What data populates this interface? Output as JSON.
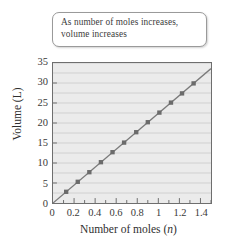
{
  "callout": {
    "line1": "As number of moles increases,",
    "line2": "volume increases"
  },
  "axes": {
    "ylabel": "Volume (L)",
    "xlabel_prefix": "Number of moles (",
    "xlabel_symbol": "n",
    "xlabel_suffix": ")",
    "yticks": [
      "0",
      "5",
      "10",
      "15",
      "20",
      "25",
      "30",
      "35"
    ],
    "xticks": [
      "0",
      "0.2",
      "0.4",
      "0.6",
      "0.8",
      "1",
      "1.2",
      "1.4"
    ]
  },
  "colors": {
    "plot_background": "#ebebeb",
    "gridline": "#c9c9c9",
    "axis": "#6e6e6e",
    "line": "#7a7a7a",
    "marker": "#6b6b6b",
    "text": "#3a3a3a"
  },
  "chart_data": {
    "type": "scatter",
    "title": "",
    "subtitle": "",
    "annotations": [
      "As number of moles increases, volume increases"
    ],
    "xlabel": "Number of moles (n)",
    "ylabel": "Volume (L)",
    "xlim": [
      0,
      1.5
    ],
    "ylim": [
      0,
      35
    ],
    "xtick_values": [
      0,
      0.2,
      0.4,
      0.6,
      0.8,
      1,
      1.2,
      1.4
    ],
    "ytick_values": [
      0,
      5,
      10,
      15,
      20,
      25,
      30,
      35
    ],
    "grid": "horizontal",
    "minor_gridline_step": 2.5,
    "minor_xtick_step": 0.1,
    "legend": null,
    "series": [
      {
        "name": "Volume vs moles",
        "marker": "square",
        "line": "solid",
        "slope": 22.4,
        "intercept": 0,
        "x": [
          0.125,
          0.235,
          0.345,
          0.455,
          0.565,
          0.675,
          0.79,
          0.9,
          1.01,
          1.12,
          1.225,
          1.335
        ],
        "y": [
          2.8,
          5.3,
          7.7,
          10.2,
          12.7,
          15.1,
          17.7,
          20.2,
          22.6,
          25.1,
          27.4,
          29.9
        ]
      }
    ],
    "trendline": {
      "x": [
        0,
        1.5
      ],
      "y": [
        0,
        33.6
      ]
    }
  }
}
